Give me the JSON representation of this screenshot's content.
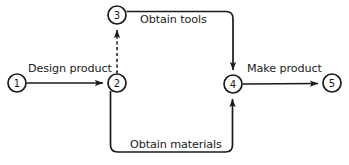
{
  "diagram": {
    "type": "activity-network",
    "background_color": "#ffffff",
    "line_color": "#1a1a1a",
    "nodes": [
      {
        "id": "1",
        "label": "1",
        "cx": 17,
        "cy": 83,
        "r": 9
      },
      {
        "id": "2",
        "label": "2",
        "cx": 117,
        "cy": 83,
        "r": 9
      },
      {
        "id": "3",
        "label": "3",
        "cx": 117,
        "cy": 15,
        "r": 9
      },
      {
        "id": "4",
        "label": "4",
        "cx": 233,
        "cy": 84,
        "r": 9
      },
      {
        "id": "5",
        "label": "5",
        "cx": 332,
        "cy": 83,
        "r": 9
      }
    ],
    "activities": [
      {
        "id": "design-product",
        "label": "Design product",
        "from": "1",
        "to": "2",
        "style": "solid",
        "label_x": 28,
        "label_y": 63
      },
      {
        "id": "obtain-tools",
        "label": "Obtain tools",
        "from": "3",
        "to": "4",
        "style": "solid",
        "label_x": 140,
        "label_y": 14
      },
      {
        "id": "obtain-materials",
        "label": "Obtain materials",
        "from": "2",
        "to": "4",
        "style": "solid",
        "label_x": 130,
        "label_y": 139
      },
      {
        "id": "make-product",
        "label": "Make product",
        "from": "4",
        "to": "5",
        "style": "solid",
        "label_x": 247,
        "label_y": 63
      },
      {
        "id": "dummy-2-3",
        "label": "",
        "from": "2",
        "to": "3",
        "style": "dashed",
        "label_x": 0,
        "label_y": 0
      }
    ]
  }
}
